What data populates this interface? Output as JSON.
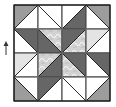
{
  "diagram": {
    "grid": {
      "rows": 4,
      "cols": 4,
      "cell_px": 24,
      "origin": [
        14,
        5
      ]
    },
    "colors": {
      "outline": "#1a1a1a",
      "grid_line": "#9a9a9a",
      "dark": "#666666",
      "medium": "#9c9c9c",
      "light": "#e4e4e4",
      "white": "#ffffff",
      "pattern_base": "#d2d2d2",
      "pattern_swirl": "#f2f2f2"
    },
    "pieces": [
      {
        "pts": [
          [
            0,
            0
          ],
          [
            1,
            0
          ],
          [
            0,
            1
          ]
        ],
        "fill": "medium"
      },
      {
        "pts": [
          [
            1,
            0
          ],
          [
            1,
            1
          ],
          [
            0,
            1
          ]
        ],
        "fill": "white"
      },
      {
        "pts": [
          [
            1,
            0
          ],
          [
            2,
            0
          ],
          [
            2,
            1
          ]
        ],
        "fill": "white"
      },
      {
        "pts": [
          [
            1,
            0
          ],
          [
            2,
            1
          ],
          [
            1,
            1
          ]
        ],
        "fill": "white"
      },
      {
        "pts": [
          [
            2,
            0
          ],
          [
            3,
            0
          ],
          [
            2,
            1
          ]
        ],
        "fill": "white"
      },
      {
        "pts": [
          [
            3,
            0
          ],
          [
            3,
            1
          ],
          [
            2,
            1
          ]
        ],
        "fill": "dark"
      },
      {
        "pts": [
          [
            3,
            0
          ],
          [
            4,
            0
          ],
          [
            4,
            1
          ]
        ],
        "fill": "medium"
      },
      {
        "pts": [
          [
            3,
            0
          ],
          [
            4,
            1
          ],
          [
            3,
            1
          ]
        ],
        "fill": "white"
      },
      {
        "pts": [
          [
            0,
            1
          ],
          [
            1,
            1
          ],
          [
            1,
            2
          ]
        ],
        "fill": "dark"
      },
      {
        "pts": [
          [
            0,
            1
          ],
          [
            1,
            2
          ],
          [
            0,
            2
          ]
        ],
        "fill": "white"
      },
      {
        "pts": [
          [
            1,
            1
          ],
          [
            1,
            2
          ],
          [
            2,
            2
          ]
        ],
        "fill": "dark"
      },
      {
        "pts": [
          [
            1,
            1
          ],
          [
            2,
            1
          ],
          [
            2,
            2
          ]
        ],
        "fill": "pattern"
      },
      {
        "pts": [
          [
            2,
            1
          ],
          [
            3,
            1
          ],
          [
            2,
            2
          ]
        ],
        "fill": "dark"
      },
      {
        "pts": [
          [
            3,
            1
          ],
          [
            3,
            2
          ],
          [
            2,
            2
          ]
        ],
        "fill": "pattern"
      },
      {
        "pts": [
          [
            3,
            1
          ],
          [
            4,
            1
          ],
          [
            3,
            2
          ]
        ],
        "fill": "light"
      },
      {
        "pts": [
          [
            4,
            1
          ],
          [
            4,
            2
          ],
          [
            3,
            2
          ]
        ],
        "fill": "white"
      },
      {
        "pts": [
          [
            0,
            2
          ],
          [
            1,
            2
          ],
          [
            0,
            3
          ]
        ],
        "fill": "light"
      },
      {
        "pts": [
          [
            1,
            2
          ],
          [
            1,
            3
          ],
          [
            0,
            3
          ]
        ],
        "fill": "white"
      },
      {
        "pts": [
          [
            1,
            2
          ],
          [
            2,
            2
          ],
          [
            1,
            3
          ]
        ],
        "fill": "pattern"
      },
      {
        "pts": [
          [
            2,
            2
          ],
          [
            2,
            3
          ],
          [
            1,
            3
          ]
        ],
        "fill": "dark"
      },
      {
        "pts": [
          [
            2,
            2
          ],
          [
            3,
            2
          ],
          [
            3,
            3
          ]
        ],
        "fill": "dark"
      },
      {
        "pts": [
          [
            2,
            2
          ],
          [
            3,
            3
          ],
          [
            2,
            3
          ]
        ],
        "fill": "pattern"
      },
      {
        "pts": [
          [
            3,
            2
          ],
          [
            4,
            2
          ],
          [
            4,
            3
          ]
        ],
        "fill": "dark"
      },
      {
        "pts": [
          [
            3,
            2
          ],
          [
            4,
            3
          ],
          [
            3,
            3
          ]
        ],
        "fill": "white"
      },
      {
        "pts": [
          [
            0,
            3
          ],
          [
            1,
            3
          ],
          [
            1,
            4
          ]
        ],
        "fill": "white"
      },
      {
        "pts": [
          [
            0,
            3
          ],
          [
            1,
            4
          ],
          [
            0,
            4
          ]
        ],
        "fill": "medium"
      },
      {
        "pts": [
          [
            1,
            3
          ],
          [
            2,
            3
          ],
          [
            1,
            4
          ]
        ],
        "fill": "dark"
      },
      {
        "pts": [
          [
            2,
            3
          ],
          [
            2,
            4
          ],
          [
            1,
            4
          ]
        ],
        "fill": "white"
      },
      {
        "pts": [
          [
            2,
            3
          ],
          [
            3,
            3
          ],
          [
            3,
            4
          ]
        ],
        "fill": "white"
      },
      {
        "pts": [
          [
            2,
            3
          ],
          [
            3,
            4
          ],
          [
            2,
            4
          ]
        ],
        "fill": "white"
      },
      {
        "pts": [
          [
            3,
            3
          ],
          [
            4,
            3
          ],
          [
            3,
            4
          ]
        ],
        "fill": "white"
      },
      {
        "pts": [
          [
            4,
            3
          ],
          [
            4,
            4
          ],
          [
            3,
            4
          ]
        ],
        "fill": "medium"
      }
    ],
    "side_arrow": {
      "direction": "up",
      "color": "#333333"
    }
  }
}
